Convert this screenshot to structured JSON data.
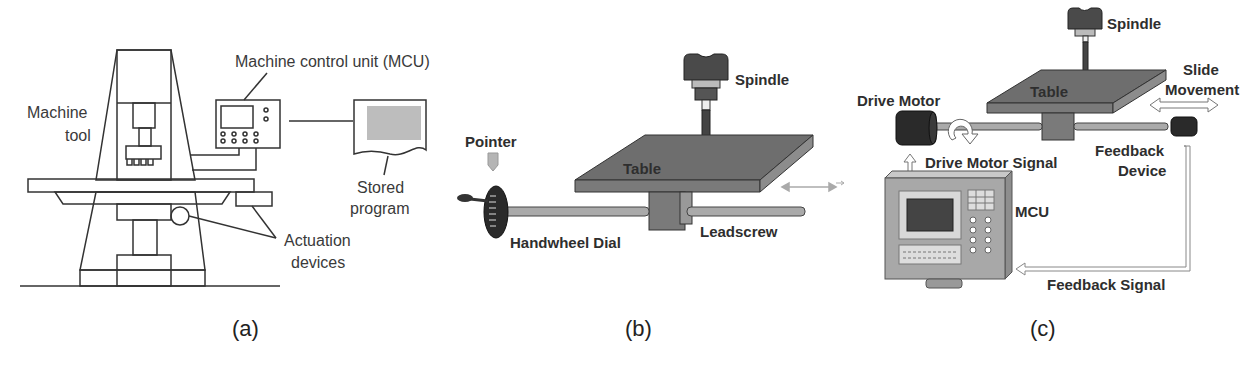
{
  "panels": [
    {
      "id": "a",
      "caption": "(a)",
      "labels": {
        "mcu": "Machine control unit (MCU)",
        "machine_tool_line1": "Machine",
        "machine_tool_line2": "tool",
        "stored_program_line1": "Stored",
        "stored_program_line2": "program",
        "actuation_line1": "Actuation",
        "actuation_line2": "devices"
      }
    },
    {
      "id": "b",
      "caption": "(b)",
      "labels": {
        "spindle": "Spindle",
        "pointer": "Pointer",
        "table": "Table",
        "handwheel": "Handwheel Dial",
        "leadscrew": "Leadscrew"
      }
    },
    {
      "id": "c",
      "caption": "(c)",
      "labels": {
        "spindle": "Spindle",
        "table": "Table",
        "slide_line1": "Slide",
        "slide_line2": "Movement",
        "drive_motor": "Drive Motor",
        "drive_motor_signal": "Drive Motor Signal",
        "feedback_device_line1": "Feedback",
        "feedback_device_line2": "Device",
        "mcu": "MCU",
        "feedback_signal": "Feedback Signal"
      }
    }
  ],
  "colors": {
    "line": "#333333",
    "table_gray": "#6e6e6e",
    "table_edge": "#8a8a8a",
    "dark": "#2a2a2a",
    "mcu_body": "#a8a8a8"
  }
}
